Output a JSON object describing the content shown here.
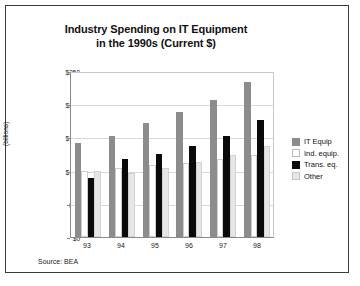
{
  "chart_data": {
    "type": "bar",
    "title": "Industry Spending on IT Equipment in the 1990s (Current $)",
    "title_line1": "Industry Spending on IT Equipment",
    "title_line2": "in the 1990s (Current $)",
    "xlabel": "",
    "ylabel": "(billions)",
    "ylim": [
      0,
      250
    ],
    "yticks": [
      0,
      50,
      100,
      150,
      200,
      250
    ],
    "ytick_labels": [
      "$0",
      "$50",
      "$100",
      "$150",
      "$200",
      "$250"
    ],
    "categories": [
      "93",
      "94",
      "95",
      "96",
      "97",
      "98"
    ],
    "grid": true,
    "legend_position": "right",
    "series": [
      {
        "name": "IT Equip",
        "color": "#8c8c8c",
        "values": [
          142,
          152,
          172,
          189,
          207,
          233
        ]
      },
      {
        "name": "Ind. equip.",
        "color": "#ffffff",
        "values": [
          100,
          104,
          108,
          112,
          118,
          124
        ]
      },
      {
        "name": "Trans. eq.",
        "color": "#0a0a0a",
        "values": [
          89,
          118,
          125,
          137,
          152,
          176
        ]
      },
      {
        "name": "Other",
        "color": "#e6e6e6",
        "values": [
          100,
          96,
          104,
          113,
          123,
          137
        ]
      }
    ],
    "annotations": [
      "Source: BEA"
    ]
  },
  "source_note": "Source: BEA"
}
